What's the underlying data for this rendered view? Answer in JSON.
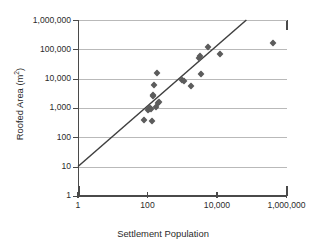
{
  "chart_data": {
    "type": "scatter",
    "title": "",
    "xlabel": "Settlement Population",
    "ylabel": "Roofed Area (m2)",
    "ylabel_base": "Roofed Area (m",
    "ylabel_sup": "2",
    "ylabel_tail": ")",
    "xscale": "log",
    "yscale": "log",
    "xlim": [
      1,
      1000000
    ],
    "ylim": [
      1,
      1000000
    ],
    "grid": "horizontal",
    "legend": "none",
    "xticks": [
      {
        "value": 1,
        "label": "1"
      },
      {
        "value": 100,
        "label": "100"
      },
      {
        "value": 10000,
        "label": "10,000"
      },
      {
        "value": 1000000,
        "label": "1,000,000"
      }
    ],
    "yticks": [
      {
        "value": 1,
        "label": "1"
      },
      {
        "value": 10,
        "label": "10"
      },
      {
        "value": 100,
        "label": "100"
      },
      {
        "value": 1000,
        "label": "1,000"
      },
      {
        "value": 10000,
        "label": "10,000"
      },
      {
        "value": 100000,
        "label": "100,000"
      },
      {
        "value": 1000000,
        "label": "1,000,000"
      }
    ],
    "series": [
      {
        "name": "Settlements",
        "marker": "diamond",
        "color": "#5c5c5c",
        "points": [
          {
            "x": 80,
            "y": 400
          },
          {
            "x": 100,
            "y": 850
          },
          {
            "x": 110,
            "y": 900
          },
          {
            "x": 120,
            "y": 1000
          },
          {
            "x": 130,
            "y": 950
          },
          {
            "x": 135,
            "y": 360
          },
          {
            "x": 140,
            "y": 2600
          },
          {
            "x": 145,
            "y": 2800
          },
          {
            "x": 150,
            "y": 6000
          },
          {
            "x": 170,
            "y": 1100
          },
          {
            "x": 190,
            "y": 16000
          },
          {
            "x": 200,
            "y": 1500
          },
          {
            "x": 210,
            "y": 1600
          },
          {
            "x": 1000,
            "y": 9000
          },
          {
            "x": 1100,
            "y": 8000
          },
          {
            "x": 1800,
            "y": 5500
          },
          {
            "x": 3000,
            "y": 50000
          },
          {
            "x": 3200,
            "y": 60000
          },
          {
            "x": 3500,
            "y": 14000
          },
          {
            "x": 5500,
            "y": 120000
          },
          {
            "x": 12000,
            "y": 70000
          },
          {
            "x": 400000,
            "y": 170000
          }
        ]
      }
    ],
    "trendline": {
      "type": "power-law",
      "from": {
        "x": 1,
        "y": 10
      },
      "to": {
        "x": 70000,
        "y": 1000000
      },
      "color": "#3f3f3f"
    }
  }
}
